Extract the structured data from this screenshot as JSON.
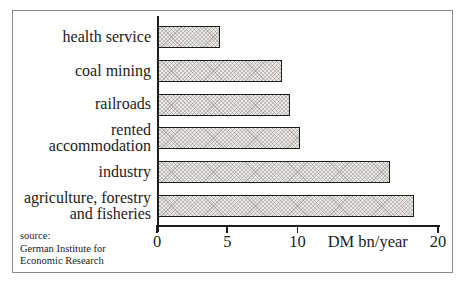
{
  "chart_data": {
    "type": "bar",
    "orientation": "horizontal",
    "title": "",
    "categories": [
      "health service",
      "coal mining",
      "railroads",
      "rented\naccommodation",
      "industry",
      "agriculture, forestry\nand fisheries"
    ],
    "values": [
      4.5,
      8.9,
      9.5,
      10.2,
      16.6,
      18.3
    ],
    "xlabel": "DM bn/year",
    "xticks": [
      "0",
      "5",
      "10",
      "20"
    ],
    "xtick_values": [
      0,
      5,
      10,
      20
    ],
    "xlim": [
      0,
      20
    ],
    "xlabel_position_value": 15,
    "grid": false,
    "legend": "none",
    "bar_fill": "#ECEAE6",
    "bar_pattern": "crosshatch-screen",
    "bar_border": "#1C1C1C",
    "frame_border": "#8A8A8A",
    "text_color": "#1C1C1C",
    "source": "source:\nGerman Institute for\nEconomic Research"
  }
}
